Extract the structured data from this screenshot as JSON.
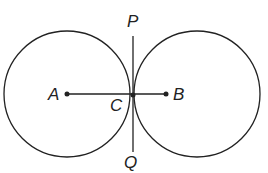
{
  "diagram": {
    "labels": {
      "P": "P",
      "A": "A",
      "B": "B",
      "C": "C",
      "Q": "Q"
    },
    "circles": [
      {
        "name": "circle-A",
        "cx": 67,
        "cy": 94,
        "r": 63
      },
      {
        "name": "circle-B",
        "cx": 197,
        "cy": 94,
        "r": 63
      }
    ],
    "segments": [
      {
        "name": "segment-AB",
        "from": "A",
        "to": "B"
      },
      {
        "name": "tangent-PQ",
        "from": "P",
        "to": "Q"
      }
    ],
    "stroke_color": "#222222"
  }
}
